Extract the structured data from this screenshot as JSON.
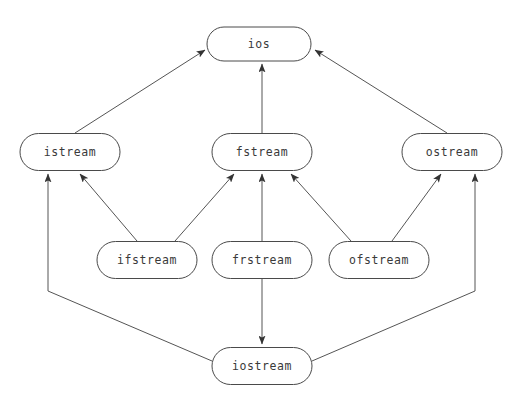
{
  "diagram": {
    "background_color": "#ffffff",
    "node_stroke_color": "#4a4a4a",
    "node_fill_color": "#ffffff",
    "edge_color": "#555555",
    "text_color": "#3a3a3a",
    "nodes": [
      {
        "id": "ios",
        "label": "ios",
        "cx": 259,
        "cy": 44,
        "w": 104,
        "h": 34
      },
      {
        "id": "istream",
        "label": "istream",
        "cx": 70,
        "cy": 152,
        "w": 100,
        "h": 37
      },
      {
        "id": "fstream",
        "label": "fstream",
        "cx": 262,
        "cy": 152,
        "w": 100,
        "h": 37
      },
      {
        "id": "ostream",
        "label": "ostream",
        "cx": 452,
        "cy": 152,
        "w": 100,
        "h": 37
      },
      {
        "id": "ifstream",
        "label": "ifstream",
        "cx": 147,
        "cy": 260,
        "w": 100,
        "h": 37
      },
      {
        "id": "frstream",
        "label": "frstream",
        "cx": 262,
        "cy": 260,
        "w": 100,
        "h": 37
      },
      {
        "id": "ofstream",
        "label": "ofstream",
        "cx": 379,
        "cy": 260,
        "w": 100,
        "h": 37
      },
      {
        "id": "iostream",
        "label": "iostream",
        "cx": 262,
        "cy": 366,
        "w": 100,
        "h": 37
      }
    ],
    "edges": [
      {
        "id": "istream-to-ios",
        "from": "istream",
        "to": "ios",
        "points": "75,133 205,50",
        "arrow_at": "end"
      },
      {
        "id": "fstream-to-ios",
        "from": "fstream",
        "to": "ios",
        "points": "262,133 262,64",
        "arrow_at": "end"
      },
      {
        "id": "ostream-to-ios",
        "from": "ostream",
        "to": "ios",
        "points": "447,133 315,50",
        "arrow_at": "end"
      },
      {
        "id": "ifstream-to-istream",
        "from": "ifstream",
        "to": "istream",
        "points": "137,241 80,174",
        "arrow_at": "end"
      },
      {
        "id": "ifstream-to-fstream",
        "from": "ifstream",
        "to": "fstream",
        "points": "175,241 234,174",
        "arrow_at": "end"
      },
      {
        "id": "frstream-to-fstream",
        "from": "frstream",
        "to": "fstream",
        "points": "262,241 262,174",
        "arrow_at": "end"
      },
      {
        "id": "ofstream-to-fstream",
        "from": "ofstream",
        "to": "fstream",
        "points": "351,241 291,174",
        "arrow_at": "end"
      },
      {
        "id": "ofstream-to-ostream",
        "from": "ofstream",
        "to": "ostream",
        "points": "392,241 441,174",
        "arrow_at": "end"
      },
      {
        "id": "frstream-to-iostream",
        "from": "frstream",
        "to": "iostream",
        "points": "262,279 262,344",
        "arrow_at": "end"
      },
      {
        "id": "iostream-to-istream",
        "from": "iostream",
        "to": "istream",
        "points": "212,361 48,291 48,174",
        "arrow_at": "end"
      },
      {
        "id": "iostream-to-ostream",
        "from": "iostream",
        "to": "ostream",
        "points": "312,361 475,291 475,174",
        "arrow_at": "end"
      }
    ]
  }
}
